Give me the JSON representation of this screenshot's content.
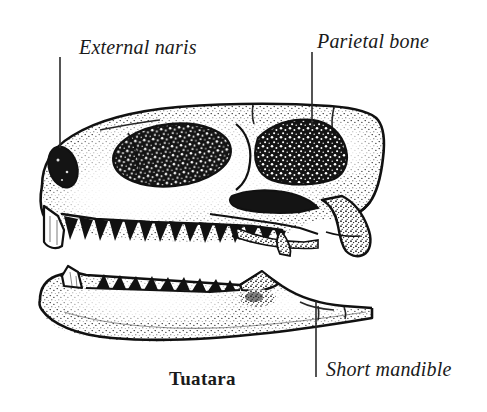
{
  "figure": {
    "title": "Tuatara",
    "background_color": "#ffffff",
    "ink_color": "#111111",
    "width": 487,
    "height": 412
  },
  "labels": {
    "external_naris": "External naris",
    "parietal_bone": "Parietal bone",
    "short_mandible": "Short mandible",
    "caption": "Tuatara"
  },
  "leaders": [
    {
      "name": "external-naris-leader",
      "x": 60,
      "y1": 57,
      "y2": 148
    },
    {
      "name": "parietal-bone-leader",
      "x": 312,
      "y1": 52,
      "y2": 128
    },
    {
      "name": "short-mandible-leader",
      "x": 316,
      "y1": 301,
      "y2": 377
    }
  ],
  "anatomy": {
    "skull": {
      "name": "skull",
      "features": [
        "external naris",
        "orbit",
        "upper temporal fenestra",
        "lower temporal fenestra",
        "quadrate",
        "premaxillary beak",
        "maxillary tooth row"
      ],
      "upper_tooth_count": 15
    },
    "mandible": {
      "name": "mandible",
      "features": [
        "anterior chisel tooth",
        "dentary tooth row",
        "coronoid process",
        "retroarticular process"
      ],
      "lower_tooth_count": 12
    }
  }
}
